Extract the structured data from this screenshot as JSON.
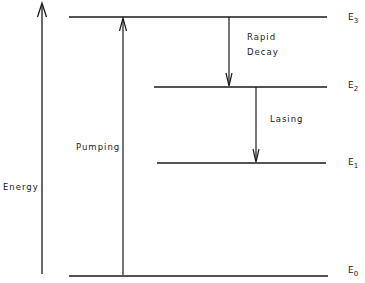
{
  "diagram": {
    "type": "energy-level-diagram",
    "axis_label": "Energy",
    "levels": [
      {
        "name": "E",
        "sub": "3",
        "y": 17,
        "x1": 69,
        "x2": 327
      },
      {
        "name": "E",
        "sub": "2",
        "y": 87,
        "x1": 154,
        "x2": 327
      },
      {
        "name": "E",
        "sub": "1",
        "y": 163,
        "x1": 157,
        "x2": 326
      },
      {
        "name": "E",
        "sub": "0",
        "y": 276,
        "x1": 69,
        "x2": 328
      }
    ],
    "transitions": [
      {
        "label": "Pumping",
        "from": "E0",
        "to": "E3",
        "direction": "up"
      },
      {
        "label_line1": "Rapid",
        "label_line2": "Decay",
        "from": "E3",
        "to": "E2",
        "direction": "down"
      },
      {
        "label": "Lasing",
        "from": "E2",
        "to": "E1",
        "direction": "down"
      }
    ],
    "colors": {
      "line": "#1a1a1a",
      "background": "#ffffff"
    }
  }
}
